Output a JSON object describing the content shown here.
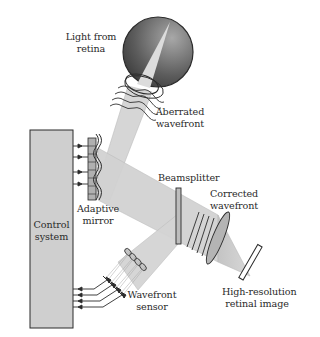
{
  "diagram": {
    "labels": {
      "light_from_retina": [
        "Light from",
        "retina"
      ],
      "aberrated_wavefront": [
        "Aberrated",
        "wavefront"
      ],
      "control_system": [
        "Control",
        "system"
      ],
      "adaptive_mirror": [
        "Adaptive",
        "mirror"
      ],
      "beamsplitter": [
        "Beamsplitter"
      ],
      "corrected_wavefront": [
        "Corrected",
        "wavefront"
      ],
      "wavefront_sensor": [
        "Wavefront",
        "sensor"
      ],
      "retinal_image": [
        "High-resolution",
        "retinal image"
      ]
    },
    "colors": {
      "beam": "#d4d4d4",
      "beam_edge": "#b8b8b8",
      "box_fill": "#cfcfcf",
      "stroke": "#2b2b2b",
      "eye_dark": "#3a3a3a",
      "eye_light": "#9a9a9a",
      "eye_cone": "#d8d8d8"
    }
  }
}
